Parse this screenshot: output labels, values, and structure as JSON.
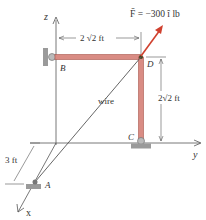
{
  "figure": {
    "force_label": "F̄ = −300 î lb",
    "dim_top": "2 √2 ft",
    "dim_right": "2√2 ft",
    "dim_left": "3 ft",
    "wire_label": "wire",
    "points": {
      "A": "A",
      "B": "B",
      "C": "C",
      "D": "D"
    },
    "axes": {
      "z": "z",
      "y": "y",
      "x": "x"
    },
    "colors": {
      "pipe": "#d98c84",
      "pipe_edge": "#a8554c",
      "force": "#d0402e",
      "support": "#9a9a9a",
      "line": "#444444"
    }
  }
}
